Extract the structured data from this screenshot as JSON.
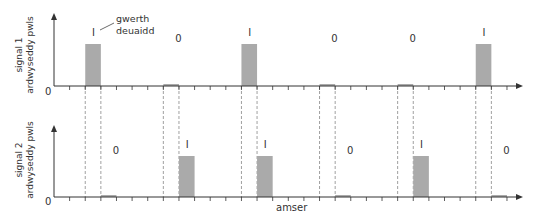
{
  "annotation": {
    "line1": "gwerth",
    "line2": "deuaidd"
  },
  "xlabel": "amser",
  "colors": {
    "bar": "#aaaaaa",
    "axis": "#333333",
    "dash": "#888888"
  },
  "chart_data": [
    {
      "type": "bar",
      "title": "signal 1",
      "ylabel": "signal 1 ardwyseddy pwls",
      "ylabel_line1": "signal 1",
      "ylabel_line2": "ardwyseddy pwls",
      "origin_label": "0",
      "bits": [
        "1",
        "0",
        "1",
        "0",
        "0",
        "1"
      ],
      "values": [
        1,
        0,
        1,
        0,
        0,
        1
      ],
      "bar_start_ticks": [
        2,
        7,
        12,
        17,
        22,
        27
      ],
      "annotation": "gwerth deuaidd"
    },
    {
      "type": "bar",
      "title": "signal 2",
      "ylabel": "signal 2 ardwyseddy pwls",
      "ylabel_line1": "signal 2",
      "ylabel_line2": "ardwyseddy pwls",
      "origin_label": "0",
      "bits": [
        "0",
        "1",
        "1",
        "0",
        "1",
        "0"
      ],
      "values": [
        0,
        1,
        1,
        0,
        1,
        0
      ],
      "bar_start_ticks": [
        3,
        8,
        13,
        18,
        23,
        28
      ],
      "xlabel": "amser"
    }
  ]
}
